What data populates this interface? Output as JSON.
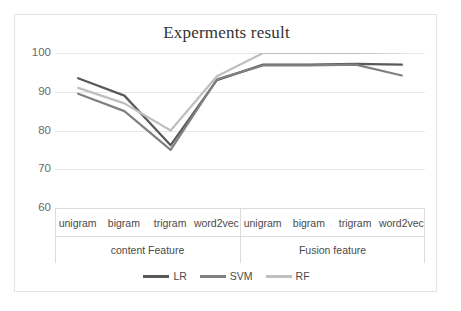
{
  "chart_data": {
    "type": "line",
    "title": "Experments result",
    "xlabel": "",
    "ylabel": "",
    "ylim": [
      60,
      100
    ],
    "yticks": [
      60,
      70,
      80,
      90,
      100
    ],
    "ytick_labels": [
      "60",
      "70",
      "80",
      "90",
      "100"
    ],
    "grid": true,
    "legend_position": "bottom",
    "categories": [
      "unigram",
      "bigram",
      "trigram",
      "word2vec",
      "unigram",
      "bigram",
      "trigram",
      "word2vec"
    ],
    "category_groups": [
      {
        "label": "content Feature",
        "span": 4
      },
      {
        "label": "Fusion feature",
        "span": 4
      }
    ],
    "series": [
      {
        "name": "LR",
        "color": "#595959",
        "values": [
          93.5,
          89.0,
          76.2,
          93.0,
          97.0,
          97.0,
          97.2,
          97.0
        ]
      },
      {
        "name": "SVM",
        "color": "#808080",
        "values": [
          89.5,
          85.0,
          75.0,
          93.2,
          96.8,
          96.8,
          97.0,
          94.2
        ]
      },
      {
        "name": "RF",
        "color": "#bfbfbf",
        "values": [
          91.0,
          87.0,
          80.0,
          94.0,
          100.0,
          100.0,
          100.0,
          100.2
        ]
      }
    ]
  },
  "colors": {
    "border": "#e4e4e4",
    "gridline": "#e8e8e8",
    "text": "#4a4a4a",
    "tick_text": "#6a6a6a",
    "title_text": "#333333"
  }
}
